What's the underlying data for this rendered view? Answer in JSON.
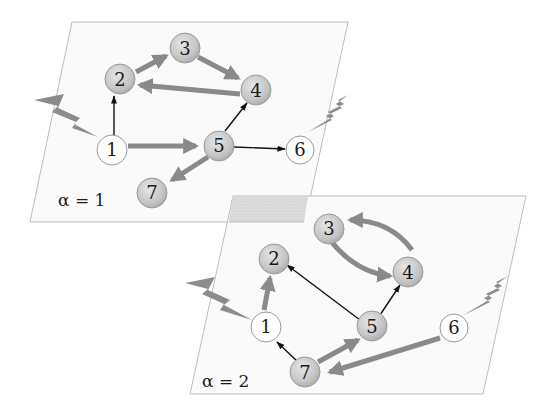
{
  "diagram": {
    "colors": {
      "plane_fill": "#fafafa",
      "plane_stroke": "#b8b8b8",
      "overlap_fill": "#d8d8d8",
      "thick_edge": "#8a8a8a",
      "thin_edge": "#111111",
      "active_node": "#c8c8c8",
      "inactive_node": "#ffffff",
      "lightning": "#8c8c8c"
    },
    "layers": [
      {
        "label": "α = 1",
        "nodes": [
          {
            "id": "1",
            "label": "1",
            "state": "inactive"
          },
          {
            "id": "2",
            "label": "2",
            "state": "active"
          },
          {
            "id": "3",
            "label": "3",
            "state": "active"
          },
          {
            "id": "4",
            "label": "4",
            "state": "active"
          },
          {
            "id": "5",
            "label": "5",
            "state": "active"
          },
          {
            "id": "6",
            "label": "6",
            "state": "inactive"
          },
          {
            "id": "7",
            "label": "7",
            "state": "active"
          }
        ],
        "edges": [
          {
            "from": "1",
            "to": "2",
            "weight": "thin"
          },
          {
            "from": "1",
            "to": "5",
            "weight": "thick"
          },
          {
            "from": "2",
            "to": "3",
            "weight": "thick"
          },
          {
            "from": "3",
            "to": "4",
            "weight": "thick"
          },
          {
            "from": "4",
            "to": "2",
            "weight": "thick"
          },
          {
            "from": "5",
            "to": "4",
            "weight": "thin"
          },
          {
            "from": "5",
            "to": "6",
            "weight": "thin"
          },
          {
            "from": "5",
            "to": "7",
            "weight": "thick"
          }
        ],
        "external_inputs": [
          "1",
          "6"
        ]
      },
      {
        "label": "α = 2",
        "nodes": [
          {
            "id": "1",
            "label": "1",
            "state": "inactive"
          },
          {
            "id": "2",
            "label": "2",
            "state": "active"
          },
          {
            "id": "3",
            "label": "3",
            "state": "active"
          },
          {
            "id": "4",
            "label": "4",
            "state": "active"
          },
          {
            "id": "5",
            "label": "5",
            "state": "active"
          },
          {
            "id": "6",
            "label": "6",
            "state": "inactive"
          },
          {
            "id": "7",
            "label": "7",
            "state": "active"
          }
        ],
        "edges": [
          {
            "from": "1",
            "to": "2",
            "weight": "thick"
          },
          {
            "from": "3",
            "to": "4",
            "weight": "thick"
          },
          {
            "from": "4",
            "to": "3",
            "weight": "thick"
          },
          {
            "from": "5",
            "to": "2",
            "weight": "thin"
          },
          {
            "from": "5",
            "to": "4",
            "weight": "thin"
          },
          {
            "from": "7",
            "to": "1",
            "weight": "thin"
          },
          {
            "from": "7",
            "to": "5",
            "weight": "thick"
          },
          {
            "from": "6",
            "to": "7",
            "weight": "thick"
          }
        ],
        "external_inputs": [
          "1",
          "6"
        ]
      }
    ]
  }
}
